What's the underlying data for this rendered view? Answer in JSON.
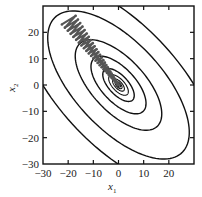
{
  "chart_data": {
    "type": "line",
    "subtype": "contour-with-optimization-path",
    "title": "",
    "xlabel": "x1",
    "ylabel": "x2",
    "xlim": [
      -30,
      30
    ],
    "ylim": [
      -30,
      30
    ],
    "xticks": [
      -30,
      -20,
      -10,
      0,
      10,
      20
    ],
    "yticks": [
      -30,
      -20,
      -10,
      0,
      10,
      20
    ],
    "grid": false,
    "legend": null,
    "contours": {
      "center": [
        0,
        0
      ],
      "rotation_deg": -45,
      "aspect_ratio": 0.47,
      "semi_major_axes": [
        50,
        36,
        22,
        14,
        8,
        5,
        3,
        1.8,
        1
      ],
      "color": "#111111"
    },
    "path": {
      "description": "Zigzag gradient-descent trajectory oscillating across the narrow valley and converging to the minimum",
      "start": [
        -20,
        25
      ],
      "end": [
        0,
        0
      ],
      "color": "#555555"
    }
  },
  "axes": {
    "x_label_main": "x",
    "x_label_sub": "1",
    "y_label_main": "x",
    "y_label_sub": "2"
  }
}
